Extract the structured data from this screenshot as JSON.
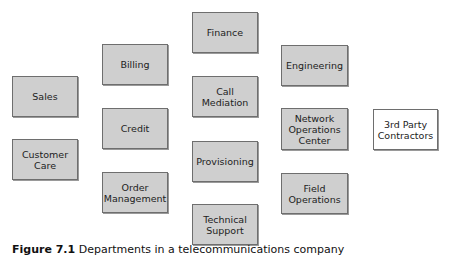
{
  "diagram": {
    "type": "organizational-departments",
    "boxes": [
      {
        "id": "sales",
        "label": "Sales",
        "x": 12,
        "y": 76,
        "w": 66,
        "h": 41,
        "fill": "#cfcfcf"
      },
      {
        "id": "customer-care",
        "label": "Customer\nCare",
        "x": 12,
        "y": 139,
        "w": 66,
        "h": 41,
        "fill": "#cfcfcf"
      },
      {
        "id": "billing",
        "label": "Billing",
        "x": 102,
        "y": 44,
        "w": 66,
        "h": 41,
        "fill": "#cfcfcf"
      },
      {
        "id": "credit",
        "label": "Credit",
        "x": 102,
        "y": 108,
        "w": 66,
        "h": 41,
        "fill": "#cfcfcf"
      },
      {
        "id": "order-management",
        "label": "Order\nManagement",
        "x": 102,
        "y": 172,
        "w": 66,
        "h": 41,
        "fill": "#cfcfcf"
      },
      {
        "id": "finance",
        "label": "Finance",
        "x": 192,
        "y": 12,
        "w": 66,
        "h": 41,
        "fill": "#cfcfcf"
      },
      {
        "id": "call-mediation",
        "label": "Call\nMediation",
        "x": 192,
        "y": 76,
        "w": 66,
        "h": 41,
        "fill": "#cfcfcf"
      },
      {
        "id": "provisioning",
        "label": "Provisioning",
        "x": 192,
        "y": 141,
        "w": 66,
        "h": 41,
        "fill": "#cfcfcf"
      },
      {
        "id": "technical-support",
        "label": "Technical\nSupport",
        "x": 192,
        "y": 204,
        "w": 66,
        "h": 41,
        "fill": "#cfcfcf"
      },
      {
        "id": "engineering",
        "label": "Engineering",
        "x": 281,
        "y": 45,
        "w": 67,
        "h": 41,
        "fill": "#cfcfcf"
      },
      {
        "id": "network-operations-center",
        "label": "Network\nOperations\nCenter",
        "x": 281,
        "y": 108,
        "w": 67,
        "h": 42,
        "fill": "#cfcfcf"
      },
      {
        "id": "field-operations",
        "label": "Field\nOperations",
        "x": 281,
        "y": 173,
        "w": 67,
        "h": 41,
        "fill": "#cfcfcf"
      },
      {
        "id": "3rd-party-contractors",
        "label": "3rd Party\nContractors",
        "x": 373,
        "y": 109,
        "w": 65,
        "h": 41,
        "fill": "#ffffff"
      }
    ]
  },
  "caption": {
    "lead": "Figure 7.1",
    "rest": " Departments in a telecommunications company"
  }
}
